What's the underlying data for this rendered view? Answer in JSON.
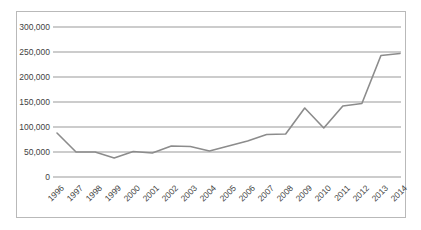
{
  "chart_data": {
    "type": "line",
    "title": "",
    "subtitle": "",
    "xlabel": "",
    "ylabel": "",
    "categories": [
      "1996",
      "1997",
      "1998",
      "1999",
      "2000",
      "2001",
      "2002",
      "2003",
      "2004",
      "2005",
      "2006",
      "2007",
      "2008",
      "2009",
      "2010",
      "2011",
      "2012",
      "2013",
      "2014"
    ],
    "series": [
      {
        "name": "",
        "values": [
          88000,
          50000,
          50000,
          38000,
          51000,
          48000,
          62000,
          61000,
          52000,
          62000,
          72000,
          85000,
          86000,
          138000,
          98000,
          142000,
          147000,
          243000,
          247000
        ]
      }
    ],
    "ylim": [
      0,
      300000
    ],
    "ytick_values": [
      0,
      50000,
      100000,
      150000,
      200000,
      250000,
      300000
    ],
    "ytick_labels": [
      "0",
      "50,000",
      "100,000",
      "150,000",
      "200,000",
      "250,000",
      "300,000"
    ],
    "grid": true,
    "grid_axis": "y",
    "legend": false,
    "legend_position": "none",
    "xtick_rotation": -45,
    "colors": {
      "series_line": "#8c8c8c",
      "gridline": "#9a9a9a",
      "frame_border": "#b9b9b9",
      "tick_text": "#3f3f3f",
      "plot_background": "#ffffff"
    }
  }
}
